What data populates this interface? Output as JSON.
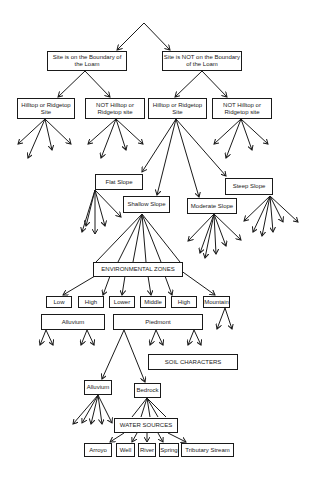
{
  "diagram": {
    "level1": [
      {
        "label": "Site is on the Boundary of the Loam"
      },
      {
        "label": "Site is NOT on the Boundary of the Loam"
      }
    ],
    "level2": [
      {
        "label": "Hilltop or Ridgetop Site"
      },
      {
        "label": "NOT Hilltop or Ridgetop site"
      },
      {
        "label": "Hilltop or Ridgetop Site"
      },
      {
        "label": "NOT Hilltop or Ridgetop site"
      }
    ],
    "slopes": [
      {
        "label": "Flat Slope"
      },
      {
        "label": "Shallow Slope"
      },
      {
        "label": "Moderate Slope"
      },
      {
        "label": "Steep Slope"
      }
    ],
    "environmental_zones": {
      "label": "ENVIRONMENTAL ZONES",
      "zones": [
        {
          "label": "Low"
        },
        {
          "label": "High"
        },
        {
          "label": "Lower"
        },
        {
          "label": "Middle"
        },
        {
          "label": "High"
        },
        {
          "label": "Mountain"
        }
      ],
      "groups": [
        {
          "label": "Alluvium"
        },
        {
          "label": "Piedmont"
        }
      ]
    },
    "soil_characters": {
      "label": "SOIL CHARACTERS"
    },
    "soils": [
      {
        "label": "Alluvium"
      },
      {
        "label": "Bedrock"
      }
    ],
    "water_sources": {
      "label": "WATER SOURCES",
      "items": [
        {
          "label": "Arroyo"
        },
        {
          "label": "Well"
        },
        {
          "label": "River"
        },
        {
          "label": "Spring"
        },
        {
          "label": "Tributary Stream"
        }
      ]
    }
  }
}
